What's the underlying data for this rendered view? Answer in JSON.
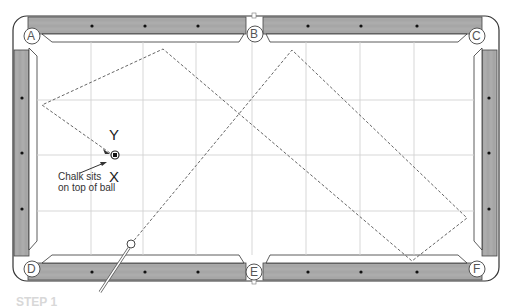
{
  "diagram": {
    "type": "billiards-table-shot-diagram",
    "pockets": [
      {
        "id": "A",
        "label": "A",
        "x": 32,
        "y": 36
      },
      {
        "id": "B",
        "label": "B",
        "x": 255,
        "y": 34
      },
      {
        "id": "C",
        "label": "C",
        "x": 477,
        "y": 36
      },
      {
        "id": "D",
        "label": "D",
        "x": 32,
        "y": 269
      },
      {
        "id": "E",
        "label": "E",
        "x": 254,
        "y": 272
      },
      {
        "id": "F",
        "label": "F",
        "x": 477,
        "y": 269
      }
    ],
    "markers": {
      "y_label": "Y",
      "x_label": "X"
    },
    "callout": {
      "line1": "Chalk sits",
      "line2": "on top of ball"
    },
    "shot_path": [
      {
        "x": 131,
        "y": 244
      },
      {
        "x": 292,
        "y": 50
      },
      {
        "x": 467,
        "y": 218
      },
      {
        "x": 412,
        "y": 261
      },
      {
        "x": 163,
        "y": 49
      },
      {
        "x": 42,
        "y": 105
      },
      {
        "x": 110,
        "y": 153
      }
    ],
    "object_ball": {
      "x": 114,
      "y": 155,
      "note": "chalk on top of ball"
    },
    "cue_ball": {
      "x": 131,
      "y": 244
    },
    "footer_text": "STEP 1",
    "colors": {
      "rail": "#a8a8a8",
      "rail_outline": "#333333",
      "cloth": "#ffffff",
      "grid": "#d0d0d0",
      "path": "#666666"
    }
  }
}
